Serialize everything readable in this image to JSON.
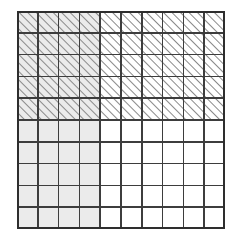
{
  "figure": {
    "grid": {
      "columns": 10,
      "rows": 10,
      "total_cells": 100,
      "cell_width": 20.8,
      "cell_height": 21.8
    },
    "regions": [
      {
        "name": "hatched-region",
        "fill": "diagonal-hatch",
        "direction": "forward-slash",
        "row_start": 1,
        "row_end": 5,
        "col_start": 1,
        "col_end": 10,
        "cell_count": 50,
        "fraction": "50/100"
      },
      {
        "name": "shaded-region",
        "fill": "light-gray",
        "row_start": 1,
        "row_end": 10,
        "col_start": 1,
        "col_end": 4,
        "cell_count": 40,
        "fraction": "40/100"
      },
      {
        "name": "overlap-region",
        "fill": "light-gray-with-hatch",
        "row_start": 1,
        "row_end": 5,
        "col_start": 1,
        "col_end": 4,
        "cell_count": 20,
        "fraction": "20/100"
      },
      {
        "name": "blank-region",
        "fill": "white",
        "row_start": 6,
        "row_end": 10,
        "col_start": 5,
        "col_end": 10,
        "cell_count": 30,
        "fraction": "30/100"
      }
    ]
  },
  "colors": {
    "background": "#ffffff",
    "grid_line": "#3d3d3d",
    "outer_border": "#2e2e2e",
    "shade_fill": "#ebebeb",
    "hatch_stroke": "#8a8a8a",
    "cell_white": "#ffffff"
  },
  "geometry": {
    "left": 17,
    "top": 11,
    "width": 208,
    "height": 218,
    "grid_line_width": 1.6,
    "outer_border_width": 2.2,
    "hatch_spacing": 6,
    "hatch_width": 1.9
  }
}
